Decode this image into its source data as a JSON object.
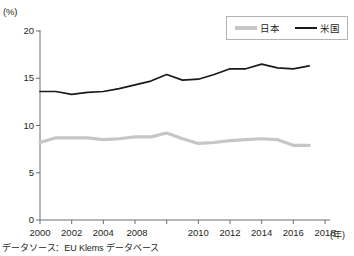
{
  "chart_data": {
    "type": "line",
    "title": "",
    "subtitle": "",
    "xlabel": "(年)",
    "ylabel": "(%)",
    "xlim": [
      2000,
      2018
    ],
    "ylim": [
      0,
      20
    ],
    "grid": false,
    "legend_position": "top-right",
    "x_tick_labels": [
      "2000",
      "2002",
      "2004",
      "2008",
      "2010",
      "2012",
      "2014",
      "2016",
      "2018"
    ],
    "x_tick_values": [
      2000,
      2002,
      2004,
      2006,
      2008,
      2010,
      2012,
      2014,
      2016,
      2018
    ],
    "y_tick_labels": [
      "20",
      "15",
      "10",
      "5",
      "0"
    ],
    "y_tick_values": [
      20,
      15,
      10,
      5,
      0
    ],
    "x": [
      2000,
      2001,
      2002,
      2003,
      2004,
      2005,
      2006,
      2007,
      2008,
      2009,
      2010,
      2011,
      2012,
      2013,
      2014,
      2015,
      2016,
      2017
    ],
    "series": [
      {
        "name": "日本",
        "color": "#c6c6c6",
        "values": [
          8.2,
          8.7,
          8.7,
          8.7,
          8.5,
          8.6,
          8.8,
          8.8,
          9.2,
          8.6,
          8.1,
          8.2,
          8.4,
          8.5,
          8.6,
          8.5,
          7.9,
          7.9
        ]
      },
      {
        "name": "米国",
        "color": "#1a1a1a",
        "values": [
          13.6,
          13.6,
          13.3,
          13.5,
          13.6,
          13.9,
          14.3,
          14.7,
          15.4,
          14.8,
          14.9,
          15.4,
          16.0,
          16.0,
          16.5,
          16.1,
          16.0,
          16.3
        ]
      }
    ],
    "annotations": []
  },
  "legend": {
    "items": [
      {
        "label": "日本",
        "swatch": "gray-line"
      },
      {
        "label": "米国",
        "swatch": "black-line"
      }
    ]
  },
  "axis": {
    "y_unit": "(%)",
    "x_unit": "(年)"
  },
  "footer": {
    "source": "データソース：EU Klems データベース"
  }
}
